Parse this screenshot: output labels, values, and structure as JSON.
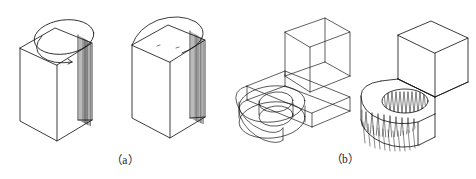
{
  "sheet": {
    "title": "Axonometric projection exercise figures",
    "background_color": "#ffffff",
    "line_color": "#1a1a1a",
    "width": 476,
    "height": 179
  },
  "captions": [
    {
      "key": "a",
      "label": "（a）"
    },
    {
      "key": "b",
      "label": "（b）"
    }
  ],
  "figures": [
    {
      "id": "fig-a-left",
      "group": "a",
      "position": "left",
      "name": "prism-with-partial-cylinder-top",
      "description": "Rectangular prism in isometric view with a cylindrical half-round section rising from the rear of the top face; an inscribed arc is visible on the top face and vertical shading lines run down the narrow right curved surface.",
      "features": [
        "rectangular prism",
        "top ellipse",
        "inner arc on top face",
        "curved right face",
        "vertical shade lines"
      ]
    },
    {
      "id": "fig-a-right",
      "group": "a",
      "position": "right",
      "name": "prism-with-rounded-top",
      "description": "Rectangular prism in isometric view capped by a full semicircular cylindrical top; the right narrow face is curved with vertical shading lines.",
      "features": [
        "rectangular prism",
        "semicircular cap",
        "curved right face",
        "vertical shade lines"
      ]
    },
    {
      "id": "fig-b-left",
      "group": "b",
      "position": "left",
      "name": "wireframe-L-bracket-construction",
      "description": "Transparent wireframe construction of an L-shaped bracket: an upright open box sits on a horizontal slab; two construction ellipses mark a vertical through hole at the slab's rounded left end.",
      "features": [
        "wireframe box",
        "horizontal slab",
        "upper ellipse",
        "lower ellipse",
        "hidden construction lines"
      ]
    },
    {
      "id": "fig-b-right",
      "group": "b",
      "position": "right",
      "name": "solid-L-bracket-with-through-hole",
      "description": "Finished solid L-shaped bracket: an upright rectangular block on a slab whose left end is rounded and pierced by a vertical through hole; the bore and the rounded outer face carry dense zig-zag shading.",
      "features": [
        "solid block",
        "rounded slab end",
        "through hole",
        "hatched bore",
        "zig-zag shaded curved face"
      ]
    }
  ]
}
